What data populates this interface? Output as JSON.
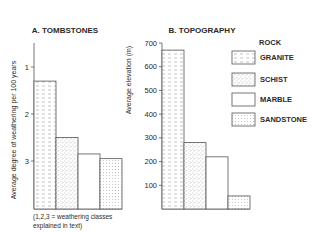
{
  "chart_data": [
    {
      "type": "bar",
      "title": "A. TOMBSTONES",
      "xlabel": "",
      "ylabel": "Average degree of weathering per 100 years",
      "ylim": [
        1,
        3.85
      ],
      "y_inverted": true,
      "yticks": [
        1,
        2,
        3
      ],
      "categories": [
        "GRANITE",
        "SCHIST",
        "MARBLE",
        "SANDSTONE"
      ],
      "values": [
        1.3,
        2.5,
        2.85,
        2.95
      ],
      "note_line1": "(1,2,3 = weathering classes",
      "note_line2": "explained in text)"
    },
    {
      "type": "bar",
      "title": "B. TOPOGRAPHY",
      "xlabel": "",
      "ylabel": "Average elevation (m)",
      "ylim": [
        0,
        700
      ],
      "yticks": [
        100,
        200,
        300,
        400,
        500,
        600,
        700
      ],
      "categories": [
        "GRANITE",
        "SCHIST",
        "MARBLE",
        "SANDSTONE"
      ],
      "values": [
        670,
        280,
        220,
        55
      ]
    }
  ],
  "legend": {
    "title": "ROCK",
    "placement": "right",
    "items": [
      {
        "label": "GRANITE",
        "pattern": "dash"
      },
      {
        "label": "SCHIST",
        "pattern": "speckle"
      },
      {
        "label": "MARBLE",
        "pattern": "none"
      },
      {
        "label": "SANDSTONE",
        "pattern": "dots"
      }
    ]
  }
}
